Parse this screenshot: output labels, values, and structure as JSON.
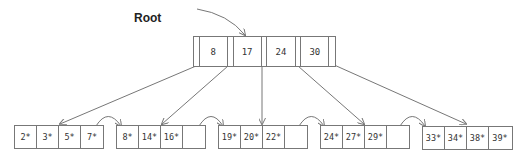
{
  "diagram": {
    "type": "B+ tree",
    "root_label": "Root",
    "root_node": {
      "keys": [
        "8",
        "17",
        "24",
        "30"
      ]
    },
    "leaves": [
      {
        "entries": [
          "2*",
          "3*",
          "5*",
          "7*"
        ]
      },
      {
        "entries": [
          "8*",
          "14*",
          "16*",
          ""
        ]
      },
      {
        "entries": [
          "19*",
          "20*",
          "22*",
          ""
        ]
      },
      {
        "entries": [
          "24*",
          "27*",
          "29*",
          ""
        ]
      },
      {
        "entries": [
          "33*",
          "34*",
          "38*",
          "39*"
        ]
      }
    ],
    "colors": {
      "line": "#777777",
      "text": "#333333",
      "background": "#ffffff"
    }
  }
}
